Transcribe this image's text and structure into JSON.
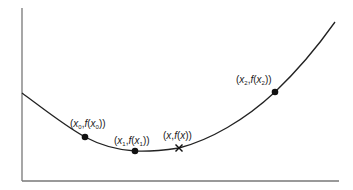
{
  "diagram": {
    "type": "curve-with-sample-points",
    "axes": {
      "x_axis": true,
      "y_axis": true,
      "color": "#777777"
    },
    "curve": {
      "color": "#222222",
      "shape": "convex, decreasing then increasing"
    },
    "points": [
      {
        "id": "p0",
        "label_var": "x",
        "label_sub": "0",
        "marker": "dot"
      },
      {
        "id": "p1",
        "label_var": "x",
        "label_sub": "1",
        "marker": "dot"
      },
      {
        "id": "px",
        "label_var": "x",
        "label_sub": "",
        "marker": "cross"
      },
      {
        "id": "p2",
        "label_var": "x",
        "label_sub": "2",
        "marker": "dot"
      }
    ],
    "labels": {
      "p0": {
        "open": "(",
        "x": "x",
        "sub": "0",
        "comma": ",",
        "f": "f",
        "open2": "(",
        "x2": "x",
        "sub2": "0",
        "close": "))"
      },
      "p1": {
        "open": "(",
        "x": "x",
        "sub": "1",
        "comma": ",",
        "f": "f",
        "open2": "(",
        "x2": "x",
        "sub2": "1",
        "close": "))"
      },
      "px": {
        "open": "(",
        "x": "x",
        "comma": ",",
        "f": "f",
        "open2": "(",
        "x2": "x",
        "close": "))"
      },
      "p2": {
        "open": "(",
        "x": "x",
        "sub": "2",
        "comma": ",",
        "f": "f",
        "open2": "(",
        "x2": "x",
        "sub2": "2",
        "close": "))"
      }
    }
  }
}
